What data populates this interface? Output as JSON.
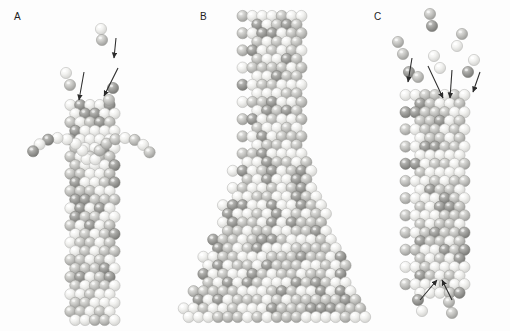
{
  "figure": {
    "type": "scientific-illustration",
    "background_color": "#fdfdfd",
    "width": 510,
    "height": 331
  },
  "panels": [
    {
      "id": "A",
      "label": "A",
      "label_x": 14,
      "label_y": 22,
      "structure": "narrow vertical column with two outward-curving single-sphere arms near the top",
      "arrows": 3,
      "column_center_x": 90,
      "column_top_y": 105,
      "column_bottom_y": 322,
      "column_width_spheres": 6,
      "free_clusters": 3
    },
    {
      "id": "B",
      "label": "B",
      "label_x": 200,
      "label_y": 22,
      "structure": "flask shaped aggregate, narrow neck at top flaring to a wide trapezoidal base",
      "arrows": 0,
      "column_center_x": 272,
      "column_top_y": 16,
      "column_bottom_y": 318,
      "neck_width_spheres": 7,
      "base_width_spheres": 20,
      "free_clusters": 0
    },
    {
      "id": "C",
      "label": "C",
      "label_x": 374,
      "label_y": 22,
      "structure": "straight vertical column with spheres attaching at the top and dimers detaching at the bottom",
      "arrows_top": 4,
      "arrows_bottom": 2,
      "column_center_x": 435,
      "column_top_y": 95,
      "column_bottom_y": 300,
      "column_width_spheres": 7,
      "free_clusters": 6
    }
  ],
  "sphere_styles": {
    "light": {
      "fill": "#f2f2f0",
      "stroke": "#b9b9b6",
      "highlight": "#ffffff"
    },
    "mid": {
      "fill": "#c8c8c5",
      "stroke": "#9a9a97",
      "highlight": "#eeeeec"
    },
    "dark": {
      "fill": "#9e9e9c",
      "stroke": "#7c7c7a",
      "highlight": "#d8d8d6"
    }
  },
  "arrow_color": "#2b2b2b",
  "chart_data": {
    "type": "diagram",
    "title": "",
    "panels": [
      "A",
      "B",
      "C"
    ],
    "legend": [],
    "annotations": [
      "A: attaching dimers indicated by three downward arrows",
      "B: no arrows; fully grown flask-shaped crystal",
      "C: four attaching arrows at top, two detaching arrows at bottom"
    ]
  }
}
